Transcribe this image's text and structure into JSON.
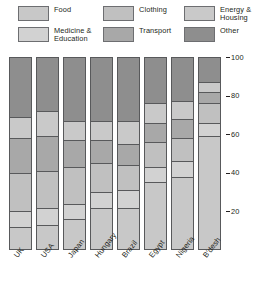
{
  "legend": {
    "columns": [
      {
        "left": 18,
        "width": 78,
        "items": [
          {
            "label": "Food",
            "key": "food"
          },
          {
            "label": "Medicine &\nEducation",
            "key": "medicine_education"
          }
        ]
      },
      {
        "left": 103,
        "width": 78,
        "items": [
          {
            "label": "Clothing",
            "key": "clothing"
          },
          {
            "label": "Transport",
            "key": "transport"
          }
        ]
      },
      {
        "left": 184,
        "width": 69,
        "items": [
          {
            "label": "Energy &\nHousing",
            "key": "energy_housing"
          },
          {
            "label": "Other",
            "key": "other"
          }
        ]
      }
    ]
  },
  "colors": {
    "food": "#c8c8c8",
    "medicine_education": "#d2d2d2",
    "clothing": "#c0c0c0",
    "transport": "#a8a8a8",
    "energy_housing": "#c9c9c9",
    "other": "#8e8e8e",
    "outline": "#58595b",
    "text": "#231f20",
    "background": "#ffffff"
  },
  "chart_data": {
    "type": "bar",
    "subtype": "stacked-100-percent",
    "title": "",
    "xlabel": "",
    "ylabel": "",
    "ylim": [
      0,
      100
    ],
    "yticks": [
      20,
      40,
      60,
      80,
      100
    ],
    "grid": false,
    "legend_position": "top",
    "categories": [
      "UK",
      "USA",
      "Japan",
      "Hungary",
      "Brazil",
      "Egypt",
      "Nigeria",
      "B'desh"
    ],
    "stack_order_bottom_to_top": [
      "food",
      "medicine_education",
      "clothing",
      "transport",
      "energy_housing",
      "other"
    ],
    "series": [
      {
        "name": "Food",
        "key": "food",
        "values": [
          12,
          13,
          16,
          22,
          22,
          35,
          38,
          59
        ]
      },
      {
        "name": "Medicine & Education",
        "key": "medicine_education",
        "values": [
          8,
          9,
          8,
          8,
          9,
          8,
          8,
          7
        ]
      },
      {
        "name": "Clothing",
        "key": "clothing",
        "values": [
          20,
          19,
          19,
          15,
          13,
          13,
          12,
          10
        ]
      },
      {
        "name": "Transport",
        "key": "transport",
        "values": [
          18,
          18,
          14,
          12,
          11,
          10,
          10,
          6
        ]
      },
      {
        "name": "Energy & Housing",
        "key": "energy_housing",
        "values": [
          11,
          13,
          10,
          10,
          12,
          10,
          9,
          5
        ]
      },
      {
        "name": "Other",
        "key": "other",
        "values": [
          31,
          28,
          33,
          33,
          33,
          24,
          23,
          13
        ]
      }
    ]
  },
  "bars": [
    {
      "label": "UK",
      "left": 9,
      "segments": [
        {
          "key": "food",
          "value": 12
        },
        {
          "key": "medicine_education",
          "value": 8
        },
        {
          "key": "clothing",
          "value": 20
        },
        {
          "key": "transport",
          "value": 18
        },
        {
          "key": "energy_housing",
          "value": 11
        },
        {
          "key": "other",
          "value": 31
        }
      ]
    },
    {
      "label": "USA",
      "left": 36,
      "segments": [
        {
          "key": "food",
          "value": 13
        },
        {
          "key": "medicine_education",
          "value": 9
        },
        {
          "key": "clothing",
          "value": 19
        },
        {
          "key": "transport",
          "value": 18
        },
        {
          "key": "energy_housing",
          "value": 13
        },
        {
          "key": "other",
          "value": 28
        }
      ]
    },
    {
      "label": "Japan",
      "left": 63,
      "segments": [
        {
          "key": "food",
          "value": 16
        },
        {
          "key": "medicine_education",
          "value": 8
        },
        {
          "key": "clothing",
          "value": 19
        },
        {
          "key": "transport",
          "value": 14
        },
        {
          "key": "energy_housing",
          "value": 10
        },
        {
          "key": "other",
          "value": 33
        }
      ]
    },
    {
      "label": "Hungary",
      "left": 90,
      "segments": [
        {
          "key": "food",
          "value": 22
        },
        {
          "key": "medicine_education",
          "value": 8
        },
        {
          "key": "clothing",
          "value": 15
        },
        {
          "key": "transport",
          "value": 12
        },
        {
          "key": "energy_housing",
          "value": 10
        },
        {
          "key": "other",
          "value": 33
        }
      ]
    },
    {
      "label": "Brazil",
      "left": 117,
      "segments": [
        {
          "key": "food",
          "value": 22
        },
        {
          "key": "medicine_education",
          "value": 9
        },
        {
          "key": "clothing",
          "value": 13
        },
        {
          "key": "transport",
          "value": 11
        },
        {
          "key": "energy_housing",
          "value": 12
        },
        {
          "key": "other",
          "value": 33
        }
      ]
    },
    {
      "label": "Egypt",
      "left": 144,
      "segments": [
        {
          "key": "food",
          "value": 35
        },
        {
          "key": "medicine_education",
          "value": 8
        },
        {
          "key": "clothing",
          "value": 13
        },
        {
          "key": "transport",
          "value": 10
        },
        {
          "key": "energy_housing",
          "value": 10
        },
        {
          "key": "other",
          "value": 24
        }
      ]
    },
    {
      "label": "Nigeria",
      "left": 171,
      "segments": [
        {
          "key": "food",
          "value": 38
        },
        {
          "key": "medicine_education",
          "value": 8
        },
        {
          "key": "clothing",
          "value": 12
        },
        {
          "key": "transport",
          "value": 10
        },
        {
          "key": "energy_housing",
          "value": 9
        },
        {
          "key": "other",
          "value": 23
        }
      ]
    },
    {
      "label": "B'desh",
      "left": 198,
      "segments": [
        {
          "key": "food",
          "value": 59
        },
        {
          "key": "medicine_education",
          "value": 7
        },
        {
          "key": "clothing",
          "value": 10
        },
        {
          "key": "transport",
          "value": 6
        },
        {
          "key": "energy_housing",
          "value": 5
        },
        {
          "key": "other",
          "value": 13
        }
      ]
    }
  ],
  "axis": {
    "ticks": [
      {
        "value": 100,
        "label": "100"
      },
      {
        "value": 80,
        "label": "80"
      },
      {
        "value": 60,
        "label": "60"
      },
      {
        "value": 40,
        "label": "40"
      },
      {
        "value": 20,
        "label": "20"
      }
    ]
  }
}
